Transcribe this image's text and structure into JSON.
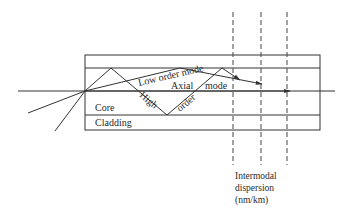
{
  "diagram": {
    "regions": {
      "core_label": "Core",
      "cladding_label": "Cladding"
    },
    "rays": {
      "low_order": "Low order mode",
      "axial_word1": "Axial",
      "axial_word2": "mode",
      "high_word1": "High",
      "high_word2": "order"
    },
    "caption": {
      "line1": "Intermodal",
      "line2": "dispersion",
      "line3": "(nm/km)"
    },
    "colors": {
      "line": "#333333",
      "text": "#2a2a2a",
      "background": "#ffffff"
    }
  }
}
